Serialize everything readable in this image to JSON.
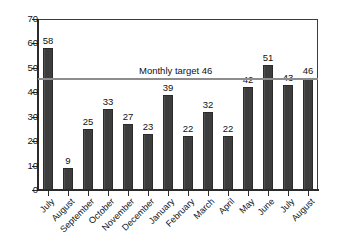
{
  "chart_data": {
    "type": "bar",
    "title": "",
    "xlabel": "",
    "ylabel": "",
    "ylim": [
      0,
      70
    ],
    "ytick_step": 10,
    "yticks": [
      0,
      10,
      20,
      30,
      40,
      50,
      60,
      70
    ],
    "grid": false,
    "legend": "none",
    "bar_color": "#3d3d3d",
    "categories": [
      "July",
      "August",
      "September",
      "October",
      "November",
      "December",
      "January",
      "February",
      "March",
      "April",
      "May",
      "June",
      "July",
      "August"
    ],
    "values": [
      58,
      9,
      25,
      33,
      27,
      23,
      39,
      22,
      32,
      22,
      42,
      51,
      43,
      46
    ],
    "show_value_labels": true,
    "annotations": [
      {
        "name": "monthly-target",
        "type": "hline",
        "value": 46,
        "label": "Monthly target 46",
        "color": "#8d8d8d"
      }
    ]
  }
}
